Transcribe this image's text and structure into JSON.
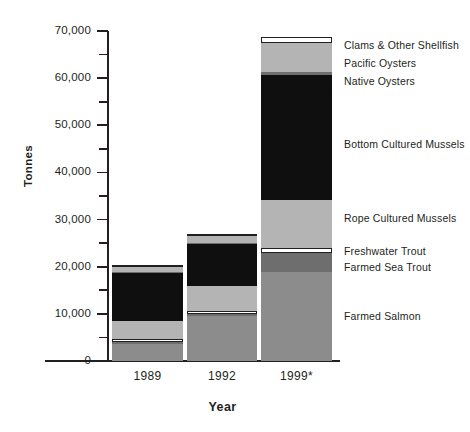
{
  "chart_data": {
    "type": "bar",
    "subtype": "stacked-bar",
    "title": "",
    "xlabel": "Year",
    "ylabel": "Tonnes",
    "categories": [
      "1989",
      "1992",
      "1999*"
    ],
    "ylim": [
      0,
      70000
    ],
    "y_ticks": [
      0,
      10000,
      20000,
      30000,
      40000,
      50000,
      60000,
      70000
    ],
    "y_tick_labels": [
      "0",
      "10,000",
      "20,000",
      "30,000",
      "40,000",
      "50,000",
      "60,000",
      "70,000"
    ],
    "y_minor_ticks": [
      5000,
      15000,
      25000,
      35000,
      45000,
      55000,
      65000
    ],
    "grid": false,
    "legend_position": "right-inline",
    "footnote_marker": "*",
    "series": [
      {
        "name": "Farmed Salmon",
        "color": "#8c8c8c",
        "values": [
          3600,
          9600,
          18900
        ]
      },
      {
        "name": "Farmed Sea Trout",
        "color": "#6e6e6e",
        "values": [
          300,
          400,
          4000
        ]
      },
      {
        "name": "Freshwater Trout",
        "color": "#ffffff",
        "values": [
          500,
          600,
          1100
        ]
      },
      {
        "name": "Rope Cultured Mussels",
        "color": "#b4b4b4",
        "values": [
          3900,
          5300,
          10200
        ]
      },
      {
        "name": "Bottom Cultured Mussels",
        "color": "#0f0f0f",
        "values": [
          10200,
          8900,
          33100
        ]
      },
      {
        "name": "Native Oysters",
        "color": "#6e6e6e",
        "values": [
          200,
          250,
          500
        ]
      },
      {
        "name": "Pacific Oysters",
        "color": "#b4b4b4",
        "values": [
          1300,
          1700,
          6600
        ]
      },
      {
        "name": "Clams & Other Shellfish",
        "color": "#ffffff",
        "values": [
          150,
          200,
          1400
        ]
      }
    ],
    "totals": [
      20150,
      26950,
      75800
    ]
  },
  "axis": {
    "y_title": "Tonnes",
    "x_title": "Year"
  },
  "legend": {
    "items": [
      {
        "label": "Clams & Other Shellfish",
        "top": 40
      },
      {
        "label": "Pacific Oysters",
        "top": 58
      },
      {
        "label": "Native Oysters",
        "top": 76
      },
      {
        "label": "Bottom Cultured Mussels",
        "top": 139
      },
      {
        "label": "Rope Cultured Mussels",
        "top": 213
      },
      {
        "label": "Freshwater Trout",
        "top": 246
      },
      {
        "label": "Farmed Sea Trout",
        "top": 262
      },
      {
        "label": "Farmed Salmon",
        "top": 311
      }
    ]
  },
  "bars": [
    {
      "label": "1989",
      "x": 112,
      "width": 71,
      "label_x": 112,
      "segments": [
        {
          "name": "Farmed Salmon",
          "color": "#8c8c8c",
          "y0": 361,
          "y1": 344,
          "outline": false
        },
        {
          "name": "Farmed Sea Trout",
          "color": "#6e6e6e",
          "y0": 344,
          "y1": 342,
          "outline": false
        },
        {
          "name": "Freshwater Trout",
          "color": "#ffffff",
          "y0": 342,
          "y1": 339,
          "outline": true
        },
        {
          "name": "Rope Cultured Mussels",
          "color": "#b4b4b4",
          "y0": 339,
          "y1": 321,
          "outline": false
        },
        {
          "name": "Bottom Cultured Mussels",
          "color": "#0f0f0f",
          "y0": 321,
          "y1": 273,
          "outline": false
        },
        {
          "name": "Native Oysters",
          "color": "#6e6e6e",
          "y0": 273,
          "y1": 272,
          "outline": false
        },
        {
          "name": "Pacific Oysters",
          "color": "#b4b4b4",
          "y0": 272,
          "y1": 266,
          "outline": false
        },
        {
          "name": "Clams & Other Shellfish",
          "color": "#ffffff",
          "y0": 266,
          "y1": 265,
          "outline": true
        }
      ]
    },
    {
      "label": "1992",
      "x": 187,
      "width": 70,
      "label_x": 187,
      "segments": [
        {
          "name": "Farmed Salmon",
          "color": "#8c8c8c",
          "y0": 361,
          "y1": 316,
          "outline": false
        },
        {
          "name": "Farmed Sea Trout",
          "color": "#6e6e6e",
          "y0": 316,
          "y1": 314,
          "outline": false
        },
        {
          "name": "Freshwater Trout",
          "color": "#ffffff",
          "y0": 314,
          "y1": 311,
          "outline": true
        },
        {
          "name": "Rope Cultured Mussels",
          "color": "#b4b4b4",
          "y0": 311,
          "y1": 286,
          "outline": false
        },
        {
          "name": "Bottom Cultured Mussels",
          "color": "#0f0f0f",
          "y0": 286,
          "y1": 244,
          "outline": false
        },
        {
          "name": "Native Oysters",
          "color": "#6e6e6e",
          "y0": 244,
          "y1": 243,
          "outline": false
        },
        {
          "name": "Pacific Oysters",
          "color": "#b4b4b4",
          "y0": 243,
          "y1": 235,
          "outline": false
        },
        {
          "name": "Clams & Other Shellfish",
          "color": "#ffffff",
          "y0": 235,
          "y1": 234,
          "outline": true
        }
      ]
    },
    {
      "label": "1999*",
      "x": 261,
      "width": 71,
      "label_x": 261,
      "segments": [
        {
          "name": "Farmed Salmon",
          "color": "#8c8c8c",
          "y0": 361,
          "y1": 272,
          "outline": false
        },
        {
          "name": "Farmed Sea Trout",
          "color": "#6e6e6e",
          "y0": 272,
          "y1": 253,
          "outline": false
        },
        {
          "name": "Freshwater Trout",
          "color": "#ffffff",
          "y0": 253,
          "y1": 248,
          "outline": true
        },
        {
          "name": "Rope Cultured Mussels",
          "color": "#b4b4b4",
          "y0": 248,
          "y1": 200,
          "outline": false
        },
        {
          "name": "Bottom Cultured Mussels",
          "color": "#0f0f0f",
          "y0": 200,
          "y1": 75,
          "outline": false
        },
        {
          "name": "Native Oysters",
          "color": "#6e6e6e",
          "y0": 75,
          "y1": 72,
          "outline": false
        },
        {
          "name": "Pacific Oysters",
          "color": "#b4b4b4",
          "y0": 72,
          "y1": 43,
          "outline": false
        },
        {
          "name": "Clams & Other Shellfish",
          "color": "#ffffff",
          "y0": 43,
          "y1": 37,
          "outline": true
        }
      ]
    }
  ],
  "scale": {
    "y_zero_px": 361,
    "y_max_px": 31,
    "y_max_value": 70000
  }
}
